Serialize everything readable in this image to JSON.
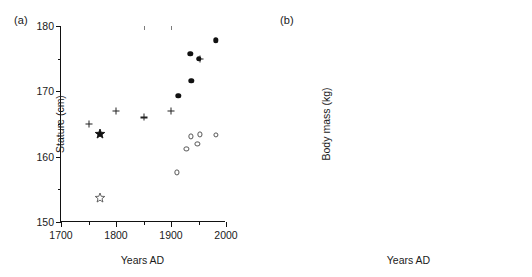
{
  "figure": {
    "panels": [
      {
        "id": "a",
        "label": "(a)",
        "xlabel": "Years AD",
        "ylabel": "Stature (cm)"
      },
      {
        "id": "b",
        "label": "(b)",
        "xlabel": "Years AD",
        "ylabel": "Body mass (kg)"
      }
    ]
  },
  "chart_data": [
    {
      "panel": "a",
      "label": "(a)",
      "type": "scatter",
      "title": "",
      "xlabel": "Years AD",
      "ylabel": "Stature (cm)",
      "xlim": [
        1700,
        2000
      ],
      "ylim": [
        150,
        180
      ],
      "xticks": [
        1700,
        1800,
        1900,
        2000
      ],
      "xticks_minor": [
        1750,
        1850,
        1950
      ],
      "yticks": [
        150,
        160,
        170,
        180
      ],
      "yticks_minor": [
        155,
        165,
        175
      ],
      "xtick_labels": [
        "1700",
        "1800",
        "1900",
        "2000"
      ],
      "ytick_labels": [
        "150",
        "160",
        "170",
        "180"
      ],
      "grid": false,
      "legend": "none",
      "series": [
        {
          "name": "plus-markers",
          "marker": "plus",
          "points": [
            {
              "x": 1750,
              "y": 165.0
            },
            {
              "x": 1800,
              "y": 167.0
            },
            {
              "x": 1850,
              "y": 166.0
            },
            {
              "x": 1900,
              "y": 167.0
            },
            {
              "x": 1952,
              "y": 175.0
            }
          ]
        },
        {
          "name": "filled-circles",
          "marker": "filled-circle",
          "points": [
            {
              "x": 1913,
              "y": 169.3
            },
            {
              "x": 1937,
              "y": 171.6
            },
            {
              "x": 1935,
              "y": 175.7
            },
            {
              "x": 1950,
              "y": 175.0
            },
            {
              "x": 1982,
              "y": 177.8
            }
          ]
        },
        {
          "name": "open-circles",
          "marker": "open-circle",
          "points": [
            {
              "x": 1911,
              "y": 157.6
            },
            {
              "x": 1928,
              "y": 161.2
            },
            {
              "x": 1936,
              "y": 163.1
            },
            {
              "x": 1948,
              "y": 161.9
            },
            {
              "x": 1953,
              "y": 163.4
            },
            {
              "x": 1982,
              "y": 163.3
            }
          ]
        },
        {
          "name": "filled-star",
          "marker": "filled-star",
          "points": [
            {
              "x": 1770,
              "y": 163.5
            }
          ]
        },
        {
          "name": "open-star",
          "marker": "open-star",
          "points": [
            {
              "x": 1770,
              "y": 153.7
            }
          ]
        }
      ]
    },
    {
      "panel": "b",
      "label": "(b)",
      "type": "scatter",
      "title": "",
      "xlabel": "Years AD",
      "ylabel": "Body mass (kg)",
      "xlim": [
        1700,
        2000
      ],
      "ylim": [
        50,
        90
      ],
      "xticks": [
        1700,
        1800,
        1900,
        2000
      ],
      "xticks_minor": [
        1750,
        1850,
        1950
      ],
      "yticks": [
        50,
        60,
        70,
        80,
        90
      ],
      "yticks_minor": [
        55,
        65,
        75,
        85
      ],
      "xtick_labels": [
        "1700",
        "1800",
        "1900",
        "2000"
      ],
      "ytick_labels": [
        "50",
        "60",
        "70",
        "80",
        "90"
      ],
      "grid": false,
      "legend": "none",
      "series": [
        {
          "name": "filled-circles",
          "marker": "filled-circle",
          "points": [
            {
              "x": 1913,
              "y": 64.0
            },
            {
              "x": 1936,
              "y": 67.0
            },
            {
              "x": 1937,
              "y": 71.7
            },
            {
              "x": 1950,
              "y": 74.0
            },
            {
              "x": 1982,
              "y": 82.1
            }
          ]
        },
        {
          "name": "open-circles",
          "marker": "open-circle",
          "points": [
            {
              "x": 1913,
              "y": 54.4
            },
            {
              "x": 1930,
              "y": 57.8
            },
            {
              "x": 1934,
              "y": 58.7
            },
            {
              "x": 1946,
              "y": 59.8
            },
            {
              "x": 1949,
              "y": 60.5
            },
            {
              "x": 1982,
              "y": 70.3
            }
          ]
        },
        {
          "name": "filled-star",
          "marker": "filled-star",
          "points": [
            {
              "x": 1770,
              "y": 61.5
            }
          ]
        },
        {
          "name": "open-star",
          "marker": "open-star",
          "points": [
            {
              "x": 1770,
              "y": 54.1
            }
          ]
        }
      ]
    }
  ]
}
